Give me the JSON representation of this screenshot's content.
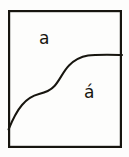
{
  "figure": {
    "background_color": "#fdfdfc",
    "ink_color": "#17150f",
    "frame": {
      "name": "bounding-rectangle",
      "x": 8,
      "y": 10,
      "width": 114,
      "height": 138,
      "stroke_width": 2.2
    },
    "divider": {
      "name": "s-curve-boundary",
      "description": "Sigmoid curve rising from the left border, flattening into a horizontal segment that terminates on the right border",
      "start_point": [
        8,
        129
      ],
      "end_point": [
        122,
        55
      ],
      "stroke_width": 2.0,
      "path": "M 8.5 129.5 C 12 121 16 112 22 105 C 27 99 33 95.5 39 94 C 45 92.6 50 91 54.5 86 C 60 80 63 71.5 69 65.5 C 74.5 60 81 56.8 88 55.6 C 95 54.5 104 54.7 122 55.0"
    },
    "labels": {
      "upper": {
        "name": "region-label-upper",
        "text": "a",
        "region": "upper-left region",
        "x": 46,
        "y": 41
      },
      "lower": {
        "name": "region-label-lower",
        "text": "á",
        "region": "lower-right region",
        "x": 90,
        "y": 95
      }
    }
  }
}
